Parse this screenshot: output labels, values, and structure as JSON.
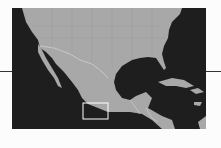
{
  "map": {
    "region": "Mexico, Central America and southern United States",
    "colors": {
      "ocean": "#1e1e1e",
      "land": "#a8a8a8",
      "borders": "#d0d0d0",
      "highlight": "#ffffff"
    },
    "highlight_box": {
      "x": 71,
      "y": 95,
      "width": 25,
      "height": 16,
      "label": "locator-rectangle"
    }
  }
}
